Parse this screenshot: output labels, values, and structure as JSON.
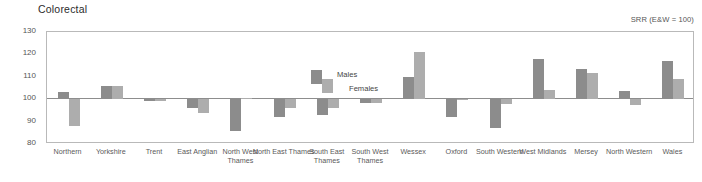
{
  "chart_data": {
    "type": "bar",
    "title": "Colorectal",
    "subtitle": "SRR (E&W = 100)",
    "xlabel": "",
    "ylabel": "",
    "ylim": [
      80,
      130
    ],
    "yticks": [
      130,
      120,
      110,
      100,
      90,
      80
    ],
    "baseline": 100,
    "grid": false,
    "legend_position": "inside-top-center",
    "categories": [
      "Northern",
      "Yorkshire",
      "Trent",
      "East Anglian",
      "North West Thames",
      "North East Thames",
      "South East Thames",
      "South West Thames",
      "Wessex",
      "Oxford",
      "South Western",
      "West Midlands",
      "Mersey",
      "North Western",
      "Wales"
    ],
    "series": [
      {
        "name": "Males",
        "color": "#8c8c8c",
        "values": [
          103,
          106,
          99,
          96,
          86,
          92,
          93,
          98.5,
          110,
          92,
          87,
          118,
          113.5,
          103.5,
          117
        ]
      },
      {
        "name": "Females",
        "color": "#adadad",
        "values": [
          88,
          106,
          99,
          94,
          100.5,
          96,
          96,
          98.5,
          121,
          99.5,
          98,
          104,
          111.5,
          97.5,
          109
        ]
      }
    ]
  },
  "colors": {
    "males": "#8c8c8c",
    "females": "#adadad",
    "axis": "#b9b9b9",
    "baseline": "#8d8d8d",
    "text": "#555555",
    "title": "#2b2b2b"
  }
}
